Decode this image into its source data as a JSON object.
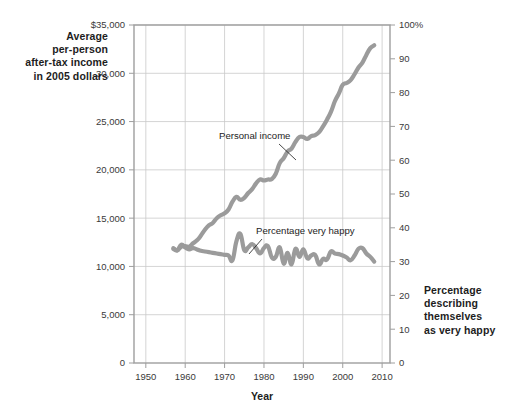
{
  "labels": {
    "left_block": "Average\nper-person\nafter-tax income\nin 2005 dollars",
    "right_block": "Percentage\ndescribing\nthemselves\nas very happy"
  },
  "chart_data": {
    "type": "line",
    "title": "",
    "xlabel": "Year",
    "ylabel": "Average per-person after-tax income in 2005 dollars",
    "y2label": "Percentage describing themselves as very happy",
    "xlim": [
      1947,
      2012
    ],
    "ylim": [
      0,
      35000
    ],
    "y2lim": [
      0,
      100
    ],
    "grid": true,
    "legend_position": "inline-annotations",
    "xticks": [
      1950,
      1960,
      1970,
      1980,
      1990,
      2000,
      2010
    ],
    "xticklabels": [
      "1950",
      "1960",
      "1970",
      "1980",
      "1990",
      "2000",
      "2010"
    ],
    "yticks": [
      0,
      5000,
      10000,
      15000,
      20000,
      25000,
      30000,
      35000
    ],
    "yticklabels": [
      "0",
      "5,000",
      "10,000",
      "15,000",
      "20,000",
      "25,000",
      "30,000",
      "$35,000"
    ],
    "y2ticks": [
      0,
      10,
      20,
      30,
      40,
      50,
      60,
      70,
      80,
      90,
      100
    ],
    "y2ticklabels": [
      "0",
      "10",
      "20",
      "30",
      "40",
      "50",
      "60",
      "70",
      "80",
      "90",
      "100%"
    ],
    "annotations": [
      {
        "text": "Personal income",
        "x": 1980,
        "y": 23000
      },
      {
        "text": "Percentage very happy",
        "x": 1988,
        "y": 15000
      }
    ],
    "series": [
      {
        "name": "Personal income",
        "axis": "left",
        "color": "#9b9b9b",
        "width": 4.2,
        "x": [
          1957,
          1958,
          1959,
          1960,
          1961,
          1962,
          1963,
          1964,
          1965,
          1966,
          1967,
          1968,
          1969,
          1970,
          1971,
          1972,
          1973,
          1974,
          1975,
          1976,
          1977,
          1978,
          1979,
          1980,
          1981,
          1982,
          1983,
          1984,
          1985,
          1986,
          1987,
          1988,
          1989,
          1990,
          1991,
          1992,
          1993,
          1994,
          1995,
          1996,
          1997,
          1998,
          1999,
          2000,
          2001,
          2002,
          2003,
          2004,
          2005,
          2006,
          2007,
          2008
        ],
        "values": [
          11800,
          11650,
          12050,
          12100,
          12050,
          12400,
          12700,
          13200,
          13800,
          14250,
          14500,
          15000,
          15300,
          15500,
          15900,
          16700,
          17200,
          16900,
          17100,
          17600,
          18000,
          18600,
          19000,
          18900,
          19000,
          19050,
          19600,
          20700,
          21200,
          21900,
          22200,
          22900,
          23400,
          23400,
          23200,
          23500,
          23600,
          23900,
          24500,
          25200,
          26000,
          27100,
          27900,
          28800,
          29000,
          29300,
          29900,
          30600,
          31100,
          31900,
          32600,
          32900
        ]
      },
      {
        "name": "Percentage very happy",
        "axis": "right",
        "color": "#9b9b9b",
        "width": 4.2,
        "x": [
          1957,
          1958,
          1959,
          1960,
          1961,
          1962,
          1963,
          1964,
          1965,
          1966,
          1967,
          1968,
          1969,
          1970,
          1971,
          1972,
          1973,
          1974,
          1975,
          1976,
          1977,
          1978,
          1979,
          1980,
          1981,
          1982,
          1983,
          1984,
          1985,
          1986,
          1987,
          1988,
          1989,
          1990,
          1991,
          1992,
          1993,
          1994,
          1995,
          1996,
          1997,
          1998,
          1999,
          2000,
          2001,
          2002,
          2003,
          2004,
          2005,
          2006,
          2007,
          2008
        ],
        "values": [
          34,
          33.4,
          35,
          34.2,
          33.6,
          34,
          33.6,
          33.2,
          33,
          32.8,
          32.6,
          32.4,
          32.2,
          32,
          31.8,
          30.4,
          36,
          38.2,
          33.4,
          34.2,
          35.2,
          34,
          32.4,
          34,
          34.6,
          31.2,
          31.4,
          34.2,
          29.4,
          32.6,
          29.2,
          33.8,
          31.4,
          33.6,
          31,
          31.8,
          32,
          29.2,
          30.8,
          30.6,
          33,
          32.4,
          32.2,
          31.8,
          31.2,
          30.4,
          31.8,
          33.8,
          34,
          32.4,
          31.4,
          30
        ]
      }
    ]
  }
}
